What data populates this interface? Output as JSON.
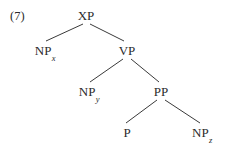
{
  "figure": {
    "example_number": "(7)",
    "background_color": "#ffffff",
    "ink_color": "#2b2b2b",
    "line_color": "#3a3a3a",
    "width": 226,
    "height": 148
  },
  "tree": {
    "description": "syntactic constituency tree",
    "nodes": [
      {
        "id": "xp",
        "label": "XP",
        "subscript": "",
        "x": 86,
        "y": 9,
        "level": 0
      },
      {
        "id": "npx",
        "label": "NP",
        "subscript": "x",
        "x": 45,
        "y": 44,
        "level": 1
      },
      {
        "id": "vp",
        "label": "VP",
        "subscript": "",
        "x": 127,
        "y": 44,
        "level": 1
      },
      {
        "id": "npy",
        "label": "NP",
        "subscript": "y",
        "x": 89,
        "y": 85,
        "level": 2
      },
      {
        "id": "pp",
        "label": "PP",
        "subscript": "",
        "x": 161,
        "y": 85,
        "level": 2
      },
      {
        "id": "p",
        "label": "P",
        "subscript": "",
        "x": 127,
        "y": 126,
        "level": 3
      },
      {
        "id": "npz",
        "label": "NP",
        "subscript": "z",
        "x": 202,
        "y": 126,
        "level": 3
      }
    ],
    "edges": [
      {
        "id": "xp-npx",
        "from": "XP",
        "to": "NPx",
        "x1": 83,
        "y1": 24,
        "x2": 46,
        "y2": 41
      },
      {
        "id": "xp-vp",
        "from": "XP",
        "to": "VP",
        "x1": 90,
        "y1": 24,
        "x2": 124,
        "y2": 41
      },
      {
        "id": "vp-npy",
        "from": "VP",
        "to": "NPy",
        "x1": 123,
        "y1": 59,
        "x2": 90,
        "y2": 82
      },
      {
        "id": "vp-pp",
        "from": "VP",
        "to": "PP",
        "x1": 131,
        "y1": 59,
        "x2": 159,
        "y2": 82
      },
      {
        "id": "pp-p",
        "from": "PP",
        "to": "P",
        "x1": 157,
        "y1": 100,
        "x2": 126,
        "y2": 123
      },
      {
        "id": "pp-npz",
        "from": "PP",
        "to": "NPz",
        "x1": 165,
        "y1": 100,
        "x2": 200,
        "y2": 123
      }
    ]
  }
}
